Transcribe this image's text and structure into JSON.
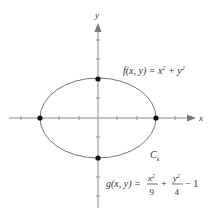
{
  "diagram": {
    "axes": {
      "x_label": "x",
      "y_label": "y"
    },
    "curve": {
      "type": "ellipse",
      "label": "C",
      "label_sub": "k",
      "a": 3,
      "b": 2
    },
    "points": [
      {
        "name": "(-3,0)"
      },
      {
        "name": "(3,0)"
      },
      {
        "name": "(0,2)"
      },
      {
        "name": "(0,-2)"
      }
    ],
    "f_eq": {
      "lhs": "f(x, y) = x",
      "sup1": "2",
      "mid": " + y",
      "sup2": "2"
    },
    "g_eq": {
      "lhs": "g(x, y) =",
      "frac1_num": "x",
      "frac1_sup": "2",
      "frac1_den": "9",
      "plus": "+",
      "frac2_num": "y",
      "frac2_sup": "2",
      "frac2_den": "4",
      "tail": "− 1"
    },
    "colors": {
      "axis": "#888888",
      "curve": "#777777",
      "point": "#111111",
      "text": "#333333"
    }
  }
}
